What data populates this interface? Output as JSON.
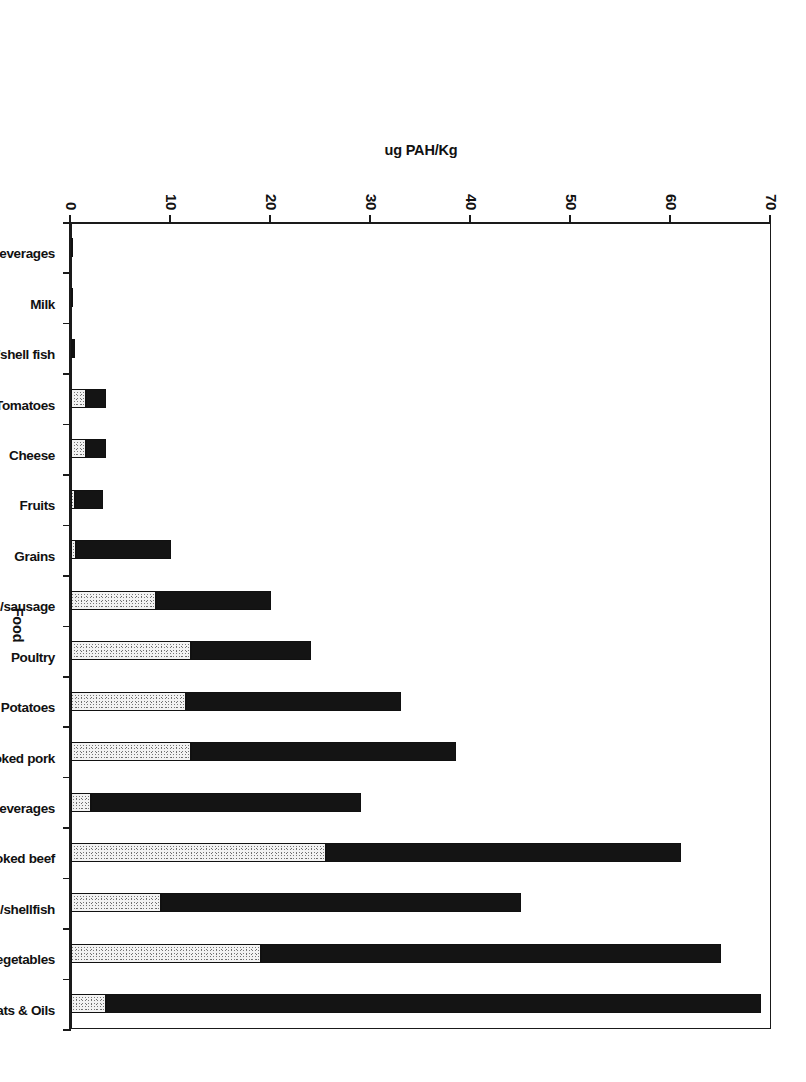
{
  "chart_data": {
    "type": "bar",
    "title": "",
    "xlabel": "Food",
    "ylabel": "ug PAH/Kg",
    "ylim": [
      0,
      70
    ],
    "yticks": [
      0,
      10,
      20,
      30,
      40,
      50,
      60,
      70
    ],
    "ytick_labels": [
      "0",
      "10",
      "20",
      "30",
      "40",
      "50",
      "60",
      "70"
    ],
    "grid": false,
    "legend": "none",
    "orientation": "rotated-90-clockwise",
    "stacked": true,
    "categories": [
      "Alcoholic beverages",
      "Milk",
      "Fish/shell fish",
      "Tomatoes",
      "Cheese",
      "Fruits",
      "Grains",
      "Frankfurters/sausage",
      "Poultry",
      "Potatoes",
      "Charcoal broiled or smoked pork",
      "Nonalcoholic beverages",
      "Charcoal broiled or smoked beef",
      "Smoked fish/shellfish",
      "Green leafy vegetables",
      "Fats & Oils"
    ],
    "series": [
      {
        "name": "lower-segment",
        "fill": "stippled",
        "values": [
          0.1,
          0.1,
          0.2,
          1.5,
          1.5,
          0.4,
          0.5,
          8.5,
          12.0,
          11.5,
          12.0,
          2.0,
          25.5,
          9.0,
          19.0,
          3.5
        ]
      },
      {
        "name": "upper-segment",
        "fill": "solid-black",
        "values": [
          0.1,
          0.1,
          0.2,
          2.0,
          2.0,
          2.8,
          9.5,
          11.5,
          12.0,
          21.5,
          26.5,
          27.0,
          35.5,
          36.0,
          46.0,
          65.5
        ]
      }
    ],
    "totals": [
      0.2,
      0.2,
      0.4,
      3.5,
      3.5,
      3.2,
      10.0,
      20.0,
      24.0,
      33.0,
      38.5,
      29.0,
      61.0,
      45.0,
      65.0,
      69.0
    ]
  },
  "axes": {
    "value_axis_title": "ug PAH/Kg",
    "category_axis_title": "Food"
  }
}
